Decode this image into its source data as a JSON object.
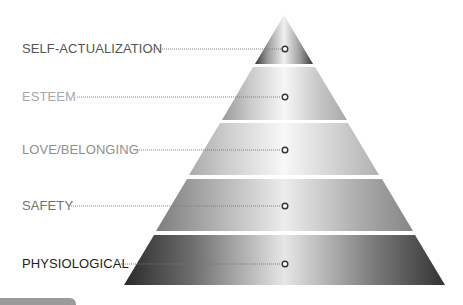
{
  "diagram": {
    "type": "pyramid",
    "apex": [
      284,
      15
    ],
    "levels": [
      {
        "label": "SELF-ACTUALIZATION",
        "label_color": "#555555",
        "label_y": 49,
        "points": "284,15 313,64 255,64",
        "marker": [
          285,
          49
        ],
        "line_start_x": 152,
        "gradient": [
          "#3a3a3a",
          "#9c9c9c",
          "#f0f0f0",
          "#9c9c9c",
          "#3a3a3a"
        ]
      },
      {
        "label": "ESTEEM",
        "label_color": "#a8a8a8",
        "label_y": 97,
        "points": "253,67 315,67 347,120 222,120",
        "marker": [
          285,
          97
        ],
        "line_start_x": 77,
        "gradient": [
          "#9a9a9a",
          "#c9c9c9",
          "#f7f7f7",
          "#c6c6c6",
          "#a8a8a8"
        ]
      },
      {
        "label": "LOVE/BELONGING",
        "label_color": "#8f8f8f",
        "label_y": 150,
        "points": "220,123 348,123 379,175 189,175",
        "marker": [
          285,
          150
        ],
        "line_start_x": 133,
        "gradient": [
          "#aaaaaa",
          "#d0d0d0",
          "#f8f8f8",
          "#d0d0d0",
          "#b0b0b0"
        ]
      },
      {
        "label": "SAFETY",
        "label_color": "#707070",
        "label_y": 206,
        "points": "187,179 382,179 413,231 156,231",
        "marker": [
          285,
          206
        ],
        "line_start_x": 71,
        "gradient": [
          "#7d7d7d",
          "#aeaeae",
          "#ececec",
          "#aeaeae",
          "#858585"
        ]
      },
      {
        "label": "PHYSIOLOGICAL",
        "label_color": "#222222",
        "label_y": 264,
        "points": "154,235 415,235 445,285 124,285",
        "marker": [
          285,
          264
        ],
        "line_start_x": 121,
        "gradient": [
          "#2a2a2a",
          "#707070",
          "#e6e6e6",
          "#7a7a7a",
          "#333333"
        ]
      }
    ],
    "connector_color": "#777777",
    "marker_stroke": "#333333",
    "marker_fill": "#ffffff"
  },
  "footer": {
    "tab_color": "#9a9a9a"
  }
}
